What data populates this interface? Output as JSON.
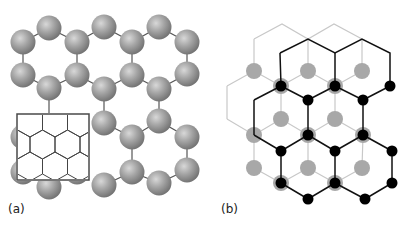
{
  "figure": {
    "panels": [
      {
        "id": "a",
        "label": "(a)",
        "description": "Ball-and-stick honeycomb lattice of spheres with inset showing hexagonal lattice lines",
        "sphere_color": "#9a9a9a",
        "bond_color": "#555555",
        "inset_color": "#333333"
      },
      {
        "id": "b",
        "label": "(b)",
        "description": "Two overlaid honeycomb lattices: gray (light) and black",
        "gray_color": "#a8a8a8",
        "black_color": "#000000"
      }
    ]
  }
}
